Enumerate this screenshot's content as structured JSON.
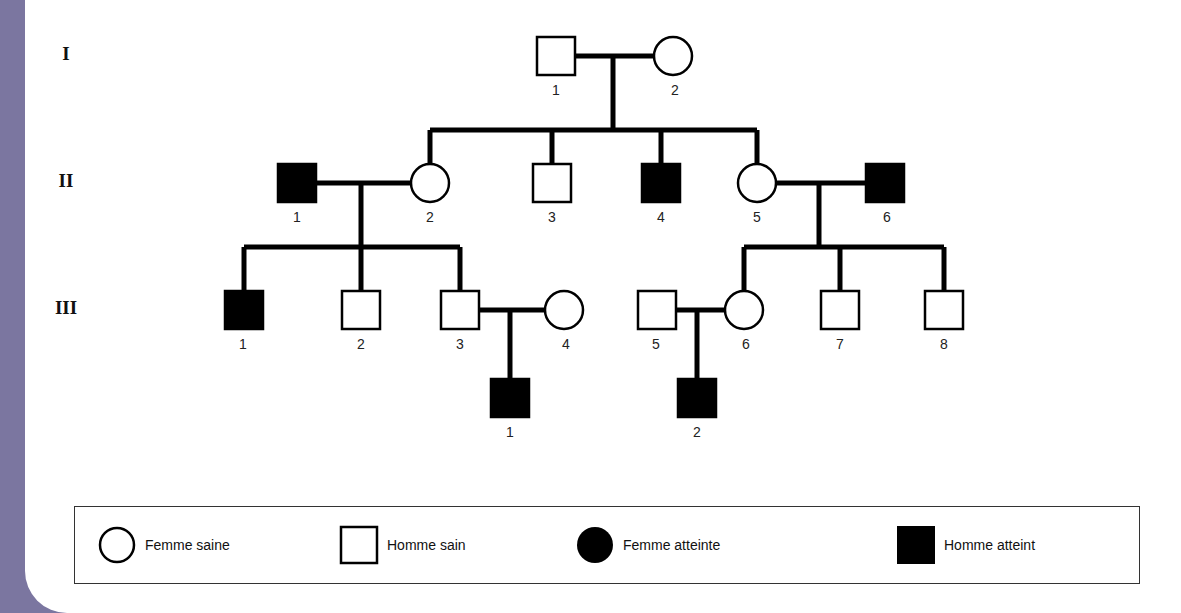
{
  "diagram": {
    "type": "pedigree",
    "generations": [
      {
        "label": "I",
        "y": 56
      },
      {
        "label": "II",
        "y": 183
      },
      {
        "label": "III",
        "y": 310
      }
    ],
    "individuals": [
      {
        "id": "I-1",
        "label": "1",
        "sex": "male",
        "affected": false,
        "x": 556,
        "y": 56
      },
      {
        "id": "I-2",
        "label": "2",
        "sex": "female",
        "affected": false,
        "x": 673,
        "y": 56
      },
      {
        "id": "II-1",
        "label": "1",
        "sex": "male",
        "affected": true,
        "x": 297,
        "y": 183
      },
      {
        "id": "II-2",
        "label": "2",
        "sex": "female",
        "affected": false,
        "x": 430,
        "y": 183
      },
      {
        "id": "II-3",
        "label": "3",
        "sex": "male",
        "affected": false,
        "x": 552,
        "y": 183
      },
      {
        "id": "II-4",
        "label": "4",
        "sex": "male",
        "affected": true,
        "x": 661,
        "y": 183
      },
      {
        "id": "II-5",
        "label": "5",
        "sex": "female",
        "affected": false,
        "x": 757,
        "y": 183
      },
      {
        "id": "II-6",
        "label": "6",
        "sex": "male",
        "affected": true,
        "x": 885,
        "y": 183
      },
      {
        "id": "III-1",
        "label": "1",
        "sex": "male",
        "affected": true,
        "x": 244,
        "y": 310
      },
      {
        "id": "III-2",
        "label": "2",
        "sex": "male",
        "affected": false,
        "x": 361,
        "y": 310
      },
      {
        "id": "III-3",
        "label": "3",
        "sex": "male",
        "affected": false,
        "x": 460,
        "y": 310
      },
      {
        "id": "III-4",
        "label": "4",
        "sex": "female",
        "affected": false,
        "x": 564,
        "y": 310
      },
      {
        "id": "III-5",
        "label": "5",
        "sex": "male",
        "affected": false,
        "x": 657,
        "y": 310
      },
      {
        "id": "III-6",
        "label": "6",
        "sex": "female",
        "affected": false,
        "x": 744,
        "y": 310
      },
      {
        "id": "III-7",
        "label": "7",
        "sex": "male",
        "affected": false,
        "x": 840,
        "y": 310
      },
      {
        "id": "III-8",
        "label": "8",
        "sex": "male",
        "affected": false,
        "x": 944,
        "y": 310
      },
      {
        "id": "IV-1",
        "label": "1",
        "sex": "male",
        "affected": true,
        "x": 510,
        "y": 398
      },
      {
        "id": "IV-2",
        "label": "2",
        "sex": "male",
        "affected": true,
        "x": 697,
        "y": 398
      }
    ],
    "couples": [
      {
        "partners": [
          "I-1",
          "I-2"
        ],
        "children": [
          "II-2",
          "II-3",
          "II-4",
          "II-5"
        ]
      },
      {
        "partners": [
          "II-1",
          "II-2"
        ],
        "children": [
          "III-1",
          "III-2",
          "III-3"
        ]
      },
      {
        "partners": [
          "II-5",
          "II-6"
        ],
        "children": [
          "III-6",
          "III-7",
          "III-8"
        ]
      },
      {
        "partners": [
          "III-3",
          "III-4"
        ],
        "children": [
          "IV-1"
        ]
      },
      {
        "partners": [
          "III-5",
          "III-6"
        ],
        "children": [
          "IV-2"
        ]
      }
    ]
  },
  "legend": {
    "items": [
      {
        "label": "Femme saine",
        "shape": "circle",
        "filled": false
      },
      {
        "label": "Homme sain",
        "shape": "square",
        "filled": false
      },
      {
        "label": "Femme atteinte",
        "shape": "circle",
        "filled": true
      },
      {
        "label": "Homme atteint",
        "shape": "square",
        "filled": true
      }
    ]
  },
  "colors": {
    "side_band": "#7b76a0",
    "symbol_stroke": "#000000",
    "affected_fill": "#000000",
    "healthy_fill": "#ffffff"
  }
}
